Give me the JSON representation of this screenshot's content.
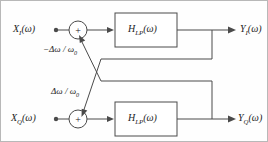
{
  "diagram": {
    "type": "signal-flow-block-diagram",
    "stroke_color": "#4a4a4a",
    "text_color": "#1c1c1c",
    "background_color": "#fefefe",
    "inputs": [
      {
        "id": "xi",
        "label": "X",
        "sub": "I",
        "arg": "(ω)"
      },
      {
        "id": "xq",
        "label": "X",
        "sub": "Q",
        "arg": "(ω)"
      }
    ],
    "outputs": [
      {
        "id": "yi",
        "label": "Y",
        "sub": "I",
        "arg": "(ω)"
      },
      {
        "id": "yq",
        "label": "Y",
        "sub": "Q",
        "arg": "(ω)"
      }
    ],
    "blocks": [
      {
        "id": "lpf_top",
        "label": "H",
        "sub": "LP",
        "arg": "(ω)"
      },
      {
        "id": "lpf_bottom",
        "label": "H",
        "sub": "LP",
        "arg": "(ω)"
      }
    ],
    "adders": [
      {
        "id": "sum_top",
        "symbol": "+"
      },
      {
        "id": "sum_bottom",
        "symbol": "+"
      }
    ],
    "gains": [
      {
        "id": "gain_neg",
        "text": "−Δω / ω",
        "sub": "0"
      },
      {
        "id": "gain_pos",
        "text": "Δω / ω",
        "sub": "0"
      }
    ]
  }
}
